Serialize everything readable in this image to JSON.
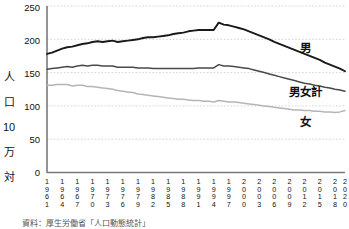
{
  "chart_data": {
    "type": "line",
    "title": "",
    "xlabel": "",
    "ylabel": "人口10万対",
    "ylim": [
      0,
      250
    ],
    "xlim": [
      1961,
      2020
    ],
    "yticks": [
      0,
      50,
      100,
      150,
      200,
      250
    ],
    "grid": true,
    "legend_position": "inline-right",
    "x": [
      1961,
      1962,
      1963,
      1964,
      1965,
      1966,
      1967,
      1968,
      1969,
      1970,
      1971,
      1972,
      1973,
      1974,
      1975,
      1976,
      1977,
      1978,
      1979,
      1980,
      1981,
      1982,
      1983,
      1984,
      1985,
      1986,
      1987,
      1988,
      1989,
      1990,
      1991,
      1992,
      1993,
      1994,
      1995,
      1996,
      1997,
      1998,
      1999,
      2000,
      2001,
      2002,
      2003,
      2004,
      2005,
      2006,
      2007,
      2008,
      2009,
      2010,
      2011,
      2012,
      2013,
      2014,
      2015,
      2016,
      2017,
      2018,
      2019,
      2020
    ],
    "xtick_labels": [
      "1961",
      "1964",
      "1967",
      "1970",
      "1973",
      "1976",
      "1979",
      "1982",
      "1985",
      "1988",
      "1991",
      "1994",
      "1997",
      "2000",
      "2003",
      "2006",
      "2009",
      "2012",
      "2015",
      "2018",
      "2020"
    ],
    "series": [
      {
        "name": "男",
        "color": "#1a1a1a",
        "width": 1.9,
        "values": [
          178,
          180,
          183,
          186,
          188,
          189,
          191,
          193,
          194,
          196,
          197,
          196,
          197,
          198,
          196,
          197,
          198,
          199,
          200,
          202,
          203,
          203,
          204,
          205,
          206,
          208,
          209,
          210,
          212,
          213,
          214,
          214,
          214,
          214,
          225,
          222,
          221,
          219,
          217,
          215,
          212,
          209,
          206,
          203,
          200,
          196,
          193,
          190,
          187,
          184,
          181,
          178,
          175,
          172,
          169,
          165,
          162,
          159,
          156,
          152
        ]
      },
      {
        "name": "男女計",
        "color": "#4a4a4a",
        "width": 1.5,
        "values": [
          155,
          156,
          157,
          158,
          159,
          158,
          160,
          161,
          160,
          161,
          161,
          160,
          160,
          160,
          158,
          158,
          158,
          158,
          157,
          157,
          157,
          156,
          156,
          156,
          156,
          156,
          156,
          156,
          156,
          156,
          157,
          157,
          157,
          157,
          162,
          160,
          160,
          159,
          158,
          157,
          156,
          154,
          152,
          150,
          148,
          146,
          144,
          142,
          140,
          138,
          136,
          134,
          133,
          131,
          130,
          128,
          127,
          125,
          124,
          122
        ]
      },
      {
        "name": "女",
        "color": "#b5b5b5",
        "width": 1.5,
        "values": [
          131,
          131,
          132,
          132,
          132,
          130,
          131,
          131,
          129,
          129,
          128,
          127,
          126,
          125,
          123,
          122,
          121,
          120,
          118,
          117,
          116,
          115,
          114,
          113,
          112,
          111,
          110,
          110,
          109,
          108,
          108,
          107,
          107,
          106,
          108,
          107,
          106,
          106,
          105,
          104,
          103,
          102,
          101,
          100,
          99,
          98,
          97,
          96,
          95,
          94,
          94,
          93,
          93,
          92,
          92,
          91,
          91,
          90,
          91,
          93
        ]
      }
    ]
  },
  "axis": {
    "y_unit_label": "人口10万対",
    "y_tick_labels": [
      "250",
      "200",
      "150",
      "100",
      "50",
      "0"
    ]
  },
  "legend": {
    "male_label": "男",
    "total_label": "男女計",
    "female_label": "女"
  },
  "caption": {
    "source_text": "資料：厚生労働省「人口動態統計」"
  }
}
